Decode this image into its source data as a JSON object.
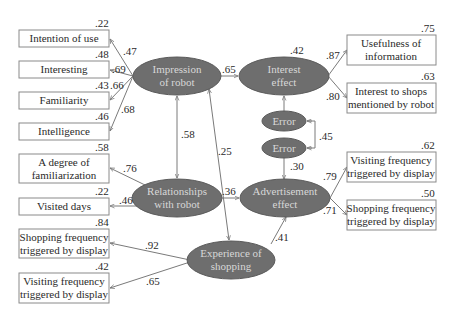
{
  "diagram": {
    "type": "structural-equation-model",
    "latent_variables": [
      {
        "id": "impression",
        "label_line1": "Impression",
        "label_line2": "of robot"
      },
      {
        "id": "interest",
        "label_line1": "Interest",
        "label_line2": "effect",
        "r2": ".42"
      },
      {
        "id": "relationships",
        "label_line1": "Relationships",
        "label_line2": "with robot"
      },
      {
        "id": "advertisement",
        "label_line1": "Advertisement",
        "label_line2": "effect"
      },
      {
        "id": "experience",
        "label_line1": "Experience of",
        "label_line2": "shopping"
      },
      {
        "id": "error1",
        "label": "Error"
      },
      {
        "id": "error2",
        "label": "Error"
      }
    ],
    "observed_left": [
      {
        "line1": "Intention of use",
        "line2": "",
        "r2": ".22",
        "loading": ".47",
        "from": "impression"
      },
      {
        "line1": "Interesting",
        "line2": "",
        "r2": ".48",
        "loading": ".69",
        "from": "impression"
      },
      {
        "line1": "Familiarity",
        "line2": "",
        "r2": ".43",
        "loading": ".66",
        "from": "impression"
      },
      {
        "line1": "Intelligence",
        "line2": "",
        "r2": ".46",
        "loading": ".68",
        "from": "impression"
      },
      {
        "line1": "A degree of",
        "line2": "familiarization",
        "r2": ".58",
        "loading": ".76",
        "from": "relationships"
      },
      {
        "line1": "Visited days",
        "line2": "",
        "r2": ".22",
        "loading": ".46",
        "from": "relationships"
      },
      {
        "line1": "Shopping frequency",
        "line2": "triggered by display",
        "r2": ".84",
        "loading": ".92",
        "from": "experience"
      },
      {
        "line1": "Visiting frequency",
        "line2": "triggered by display",
        "r2": ".42",
        "loading": ".65",
        "from": "experience"
      }
    ],
    "observed_right": [
      {
        "line1": "Usefulness of",
        "line2": "information",
        "r2": ".75",
        "loading": ".87",
        "from": "interest"
      },
      {
        "line1": "Interest to shops",
        "line2": "mentioned by robot",
        "r2": ".63",
        "loading": ".80",
        "from": "interest"
      },
      {
        "line1": "Visiting frequency",
        "line2": "triggered by display",
        "r2": ".62",
        "loading": ".79",
        "from": "advertisement"
      },
      {
        "line1": "Shopping frequency",
        "line2": "triggered by display",
        "r2": ".50",
        "loading": ".71",
        "from": "advertisement"
      }
    ],
    "paths": [
      {
        "from": "impression",
        "to": "interest",
        "coef": ".65"
      },
      {
        "from": "relationships",
        "to": "advertisement",
        "coef": ".36"
      },
      {
        "from": "experience",
        "to": "advertisement",
        "coef": ".41"
      },
      {
        "from": "error2",
        "to": "advertisement",
        "coef": ".30"
      },
      {
        "from": "error1",
        "to": "interest",
        "coef": ""
      }
    ],
    "covariances": [
      {
        "a": "impression",
        "b": "relationships",
        "coef": ".58"
      },
      {
        "a": "impression",
        "b": "experience",
        "coef": ".25"
      },
      {
        "a": "error1",
        "b": "error2",
        "coef": ".45"
      }
    ]
  },
  "colors": {
    "latent_fill": "#6e6e6e",
    "latent_text": "#d8d8d8",
    "box_stroke": "#8a8a8a",
    "arrow": "#7a7a7a"
  }
}
